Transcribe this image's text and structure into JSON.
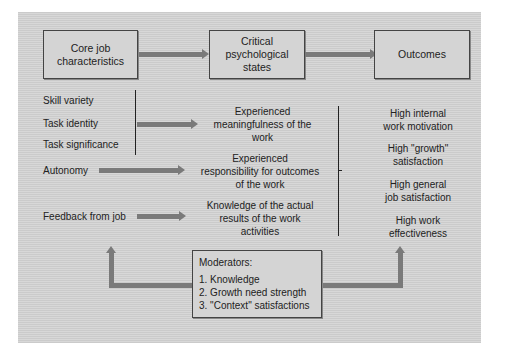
{
  "diagram": {
    "header_boxes": [
      {
        "label": "Core job\ncharacteristics"
      },
      {
        "label": "Critical\npsychological\nstates"
      },
      {
        "label": "Outcomes"
      }
    ],
    "core_characteristics": [
      "Skill variety",
      "Task identity",
      "Task significance",
      "Autonomy",
      "Feedback from job"
    ],
    "psychological_states": [
      "Experienced\nmeaningfulness of the\nwork",
      "Experienced\nresponsibility for outcomes\nof the work",
      "Knowledge of the actual\nresults of the work\nactivities"
    ],
    "outcomes": [
      "High internal\nwork motivation",
      "High \"growth\"\nsatisfaction",
      "High general\njob satisfaction",
      "High work\neffectiveness"
    ],
    "moderators": {
      "title": "Moderators:",
      "items": [
        "1. Knowledge",
        "2. Growth need strength",
        "3. \"Context\" satisfactions"
      ]
    },
    "colors": {
      "background": "#d2d2d2",
      "box_fill": "#d4d4d4",
      "arrow": "#7a7a7a",
      "line": "#222222"
    }
  }
}
